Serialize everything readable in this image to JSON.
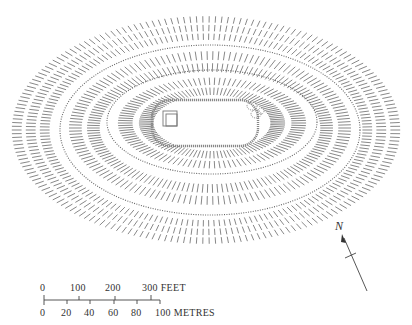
{
  "figure": {
    "type": "hachured earthwork site plan",
    "colors": {
      "ink": "#555555",
      "background": "#ffffff"
    }
  },
  "plan": {
    "features": [
      {
        "name": "outer-rampart",
        "cx": 206,
        "cy": 130,
        "rx": 200,
        "ry": 118
      },
      {
        "name": "middle-rampart",
        "cx": 210,
        "cy": 130,
        "rx": 150,
        "ry": 85
      },
      {
        "name": "inner-rampart",
        "cx": 212,
        "cy": 122,
        "rx": 105,
        "ry": 52
      },
      {
        "name": "central-enclosure",
        "x": 152,
        "y": 100,
        "w": 106,
        "h": 46
      }
    ]
  },
  "scale_bar": {
    "feet_labels": [
      "0",
      "100",
      "200",
      "300 FEET"
    ],
    "metre_labels": [
      "0",
      "20",
      "40",
      "60",
      "80",
      "100 METRES"
    ]
  },
  "north_arrow": {
    "label": "N"
  }
}
